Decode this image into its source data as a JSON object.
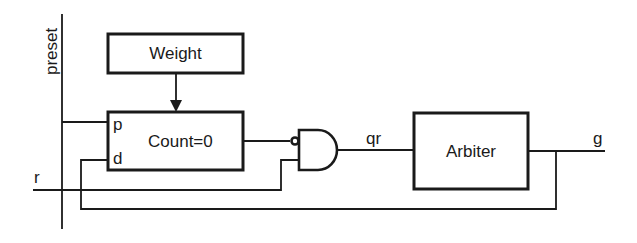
{
  "diagram": {
    "type": "logic-circuit",
    "signals": {
      "preset": "preset",
      "r": "r",
      "qr": "qr",
      "g": "g"
    },
    "blocks": {
      "weight": {
        "label": "Weight"
      },
      "counter": {
        "label": "Count=0",
        "port_p": "p",
        "port_d": "d"
      },
      "and_gate": {
        "label": "AND",
        "inverted_input": "counter-output"
      },
      "arbiter": {
        "label": "Arbiter"
      }
    },
    "connections": [
      {
        "from": "weight",
        "to": "counter",
        "kind": "arrow"
      },
      {
        "from": "preset",
        "to": "counter.p"
      },
      {
        "from": "counter",
        "to": "and_gate",
        "inverted": true
      },
      {
        "from": "r",
        "to": "and_gate"
      },
      {
        "from": "and_gate",
        "to": "arbiter",
        "label": "qr"
      },
      {
        "from": "arbiter",
        "to": "g"
      },
      {
        "from": "g",
        "to": "counter.d",
        "kind": "feedback"
      }
    ],
    "colors": {
      "ink": "#1a1a1a",
      "background": "#ffffff"
    }
  }
}
